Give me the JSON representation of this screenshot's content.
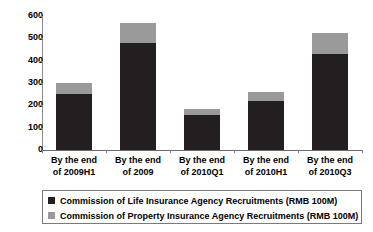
{
  "chart_data": {
    "type": "bar",
    "stacked": true,
    "title": "",
    "subtitle": "",
    "xlabel": "",
    "ylabel": "",
    "ylim": [
      0,
      600
    ],
    "ytick_values": [
      600,
      500,
      400,
      300,
      200,
      100,
      0
    ],
    "ytick_labels": [
      "600",
      "500",
      "400",
      "300",
      "200",
      "100",
      "0"
    ],
    "grid": false,
    "legend_position": "bottom",
    "categories": [
      "By the end of 2009H1",
      "By the end of 2009",
      "By the end of 2010Q1",
      "By the end of 2010H1",
      "By the end of 2010Q3"
    ],
    "category_lines": [
      [
        "By the end",
        "of 2009H1"
      ],
      [
        "By the end",
        "of 2009"
      ],
      [
        "By the end",
        "of 2010Q1"
      ],
      [
        "By the end",
        "of 2010H1"
      ],
      [
        "By the end",
        "of 2010Q3"
      ]
    ],
    "series": [
      {
        "name": "Commission of Life Insurance Agency Recruitments (RMB 100M)",
        "color": "#231f20",
        "values": [
          250,
          480,
          157,
          220,
          430
        ]
      },
      {
        "name": "Commission of Property Insurance Agency Recruitments (RMB 100M)",
        "color": "#9a9a9a",
        "values": [
          50,
          90,
          25,
          42,
          95
        ]
      }
    ],
    "totals": [
      300,
      570,
      182,
      262,
      525
    ]
  },
  "legend": {
    "items": [
      {
        "label": "Commission of Life Insurance Agency Recruitments (RMB 100M)",
        "color": "#231f20"
      },
      {
        "label": "Commission of Property Insurance Agency Recruitments (RMB 100M)",
        "color": "#9a9a9a"
      }
    ]
  },
  "colors": {
    "life": "#231f20",
    "property": "#9a9a9a",
    "axis": "#8a8a8a",
    "background": "#ffffff",
    "text": "#000000"
  }
}
